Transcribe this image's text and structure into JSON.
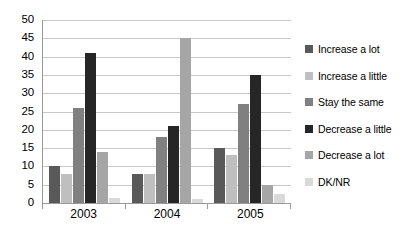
{
  "chart_data": {
    "type": "bar",
    "title": "",
    "subtitle": "",
    "xlabel": "",
    "ylabel": "",
    "categories": [
      "2003",
      "2004",
      "2005"
    ],
    "ylim": [
      0,
      50
    ],
    "y_ticks": [
      0,
      5,
      10,
      15,
      20,
      25,
      30,
      35,
      40,
      45,
      50
    ],
    "y_tick_labels": [
      "0",
      "5",
      "10",
      "15",
      "20",
      "25",
      "30",
      "35",
      "40",
      "45",
      "50"
    ],
    "grid": "horizontal",
    "legend_position": "right",
    "series": [
      {
        "name": "Increase a lot",
        "color": "#595959",
        "values": [
          10,
          8,
          15
        ]
      },
      {
        "name": "Increase a little",
        "color": "#bfbfbf",
        "values": [
          8,
          8,
          13
        ]
      },
      {
        "name": "Stay the same",
        "color": "#808080",
        "values": [
          26,
          18,
          27
        ]
      },
      {
        "name": "Decrease a little",
        "color": "#262626",
        "values": [
          41,
          21,
          35
        ]
      },
      {
        "name": "Decrease a lot",
        "color": "#a6a6a6",
        "values": [
          14,
          45,
          5
        ]
      },
      {
        "name": "DK/NR",
        "color": "#d9d9d9",
        "values": [
          1.5,
          1,
          2.5
        ]
      }
    ]
  }
}
